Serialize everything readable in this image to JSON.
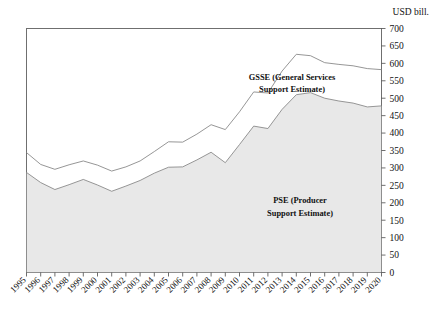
{
  "chart_data": {
    "type": "area",
    "stacked": true,
    "title": "",
    "subtitle": "",
    "xlabel": "",
    "ylabel": "USD bill.",
    "unit_label": "USD bill.",
    "ylim": [
      0,
      700
    ],
    "ytick_step": 50,
    "ytick_labels": [
      "700",
      "650",
      "600",
      "550",
      "500",
      "450",
      "400",
      "350",
      "300",
      "250",
      "200",
      "150",
      "100",
      "50",
      "0"
    ],
    "ytick_values": [
      700,
      650,
      600,
      550,
      500,
      450,
      400,
      350,
      300,
      250,
      200,
      150,
      100,
      50,
      0
    ],
    "grid": false,
    "legend_position": "inline-annotation",
    "categories": [
      "1995",
      "1996",
      "1997",
      "1998",
      "1999",
      "2000",
      "2001",
      "2002",
      "2003",
      "2004",
      "2005",
      "2006",
      "2007",
      "2008",
      "2009",
      "2010",
      "2011",
      "2012",
      "2013",
      "2014",
      "2015",
      "2016",
      "2017",
      "2018",
      "2019",
      "2020"
    ],
    "x": [
      1995,
      1996,
      1997,
      1998,
      1999,
      2000,
      2001,
      2002,
      2003,
      2004,
      2005,
      2006,
      2007,
      2008,
      2009,
      2010,
      2011,
      2012,
      2013,
      2014,
      2015,
      2016,
      2017,
      2018,
      2019,
      2020
    ],
    "series": [
      {
        "name": "PSE (Producer Support Estimate)",
        "label": "PSE (Producer",
        "label_line2": "Support Estimate)",
        "fill_color": "#e8e8e8",
        "line_color": "#8a8a8a",
        "values": [
          287,
          258,
          238,
          252,
          267,
          251,
          233,
          248,
          264,
          285,
          302,
          303,
          323,
          345,
          315,
          367,
          420,
          413,
          468,
          510,
          516,
          500,
          492,
          486,
          475,
          478
        ]
      },
      {
        "name": "GSSE (General Services Support Estimate)",
        "label": "GSSE (General Services",
        "label_line2": "Support Estimate)",
        "fill_color": "#ffffff",
        "line_color": "#8a8a8a",
        "values": [
          57,
          52,
          58,
          57,
          53,
          57,
          58,
          55,
          56,
          62,
          73,
          71,
          74,
          79,
          95,
          94,
          98,
          102,
          110,
          116,
          106,
          102,
          105,
          107,
          110,
          104
        ]
      }
    ],
    "cumulative_top": [
      344,
      310,
      296,
      309,
      320,
      308,
      291,
      303,
      320,
      347,
      375,
      374,
      397,
      424,
      410,
      461,
      518,
      515,
      578,
      626,
      622,
      602,
      597,
      593,
      585,
      582
    ],
    "annotations": [
      {
        "name": "gsse-label",
        "text": "GSSE (General Services Support Estimate)"
      },
      {
        "name": "pse-label",
        "text": "PSE (Producer Support Estimate)"
      }
    ]
  },
  "axis": {
    "unit": "USD bill."
  }
}
